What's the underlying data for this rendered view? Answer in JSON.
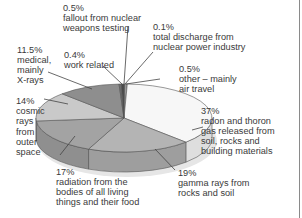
{
  "chart_data": {
    "type": "pie",
    "style": "3d",
    "title": "",
    "unit": "%",
    "slices": [
      {
        "label": "total discharge from nuclear power industry",
        "value": 0.1,
        "color": "#5a5a5a"
      },
      {
        "label": "other – mainly air travel",
        "value": 0.5,
        "color": "#9a9a9a"
      },
      {
        "label": "radon and thoron gas released from soil, rocks and building materials",
        "value": 37,
        "color": "#f7f7f7"
      },
      {
        "label": "gamma rays from rocks and soil",
        "value": 19,
        "color": "#b4b4b4"
      },
      {
        "label": "radiation from the bodies of all living things and their food",
        "value": 17,
        "color": "#a3a3a3"
      },
      {
        "label": "cosmic rays from outer space",
        "value": 14,
        "color": "#c9c9c9"
      },
      {
        "label": "medical, mainly X-rays",
        "value": 11.5,
        "color": "#8e8e8e"
      },
      {
        "label": "work related",
        "value": 0.4,
        "color": "#6e6e6e"
      },
      {
        "label": "fallout from nuclear weapons testing",
        "value": 0.5,
        "color": "#4a4a4a"
      }
    ]
  },
  "labels": {
    "fallout": {
      "pct": "0.5%",
      "l1": "fallout from nuclear",
      "l2": "weapons testing"
    },
    "nuclear_power": {
      "pct": "0.1%",
      "l1": "total discharge from",
      "l2": "nuclear power industry"
    },
    "medical": {
      "pct": "11.5%",
      "l1": "medical,",
      "l2": "mainly",
      "l3": "X-rays"
    },
    "work": {
      "pct": "0.4%",
      "l1": "work related"
    },
    "other": {
      "pct": "0.5%",
      "l1": "other – mainly",
      "l2": "air travel"
    },
    "cosmic": {
      "pct": "14%",
      "l1": "cosmic",
      "l2": "rays",
      "l3": "from",
      "l4": "outer",
      "l5": "space"
    },
    "radon": {
      "pct": "37%",
      "l1": "radon and thoron",
      "l2": "gas released from",
      "l3": "soil, rocks and",
      "l4": "building materials"
    },
    "bodies": {
      "pct": "17%",
      "l1": "radiation from the",
      "l2": "bodies of all living",
      "l3": "things and their food"
    },
    "gamma": {
      "pct": "19%",
      "l1": "gamma rays from",
      "l2": "rocks and soil"
    }
  }
}
